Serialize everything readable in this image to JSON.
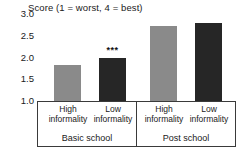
{
  "chart_data": {
    "type": "bar",
    "title": "Score (1 = worst, 4 = best)",
    "xlabel": "",
    "ylabel": "",
    "ylim": [
      1.0,
      3.0
    ],
    "yticks": [
      "3.0",
      "2.5",
      "2.0",
      "1.5",
      "1.0"
    ],
    "ytick_values": [
      3.0,
      2.5,
      2.0,
      1.5,
      1.0
    ],
    "grid": false,
    "legend": "none",
    "groups": [
      {
        "name": "Basic school",
        "categories": [
          "High informality",
          "Low informality"
        ],
        "values": [
          1.83,
          2.0
        ],
        "colors": [
          "#8a8a8a",
          "#262626"
        ],
        "annotations": [
          "",
          "***"
        ]
      },
      {
        "name": "Post school",
        "categories": [
          "High informality",
          "Low informality"
        ],
        "values": [
          2.72,
          2.8
        ],
        "colors": [
          "#8a8a8a",
          "#262626"
        ],
        "annotations": [
          "",
          ""
        ]
      }
    ],
    "categories": [
      "High informality",
      "Low informality",
      "High informality",
      "Low informality"
    ],
    "values": [
      1.83,
      2.0,
      2.72,
      2.8
    ],
    "annotations": [
      "",
      "***",
      "",
      ""
    ],
    "bar_colors": [
      "#8a8a8a",
      "#262626",
      "#8a8a8a",
      "#262626"
    ],
    "significance_note": "*** denotes significance marker above Low informality bar in Basic school group"
  },
  "axis": {
    "tick_0": "3.0",
    "tick_1": "2.5",
    "tick_2": "2.0",
    "tick_3": "1.5",
    "tick_4": "1.0"
  },
  "labels": {
    "cat_0_line1": "High",
    "cat_0_line2": "informality",
    "cat_1_line1": "Low",
    "cat_1_line2": "informality",
    "cat_2_line1": "High",
    "cat_2_line2": "informality",
    "cat_3_line1": "Low",
    "cat_3_line2": "informality",
    "group_0": "Basic school",
    "group_1": "Post school",
    "sig_marker_bar_1": "***"
  }
}
